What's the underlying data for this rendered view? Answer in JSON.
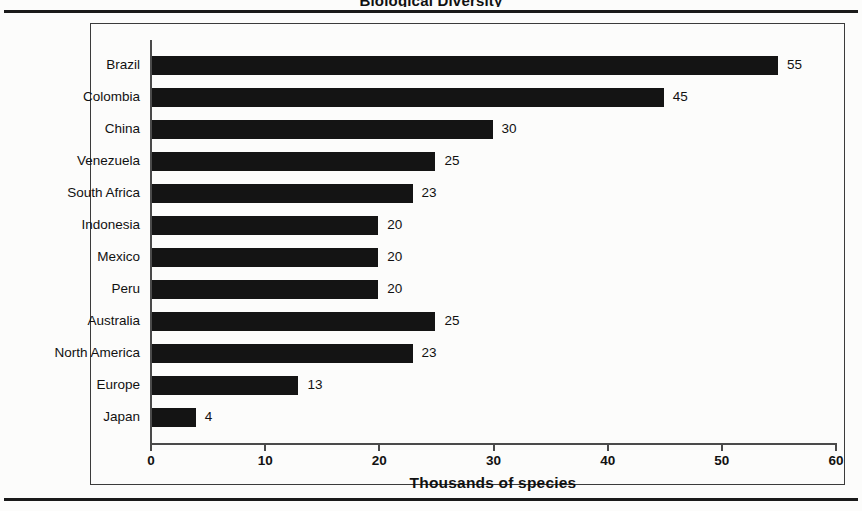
{
  "page": {
    "cut_off_title": "Biological Diversity",
    "background_color": "#fcfcfb",
    "rule_color": "#1a1a1a"
  },
  "chart_data": {
    "type": "bar",
    "orientation": "horizontal",
    "title": "Biological Diversity",
    "xlabel": "Thousands of species",
    "ylabel": "",
    "xlim": [
      0,
      60
    ],
    "xticks": [
      0,
      10,
      20,
      30,
      40,
      50,
      60
    ],
    "xtick_labels": [
      "0",
      "10",
      "20",
      "30",
      "40",
      "50",
      "60"
    ],
    "grid": false,
    "legend": false,
    "bar_color": "#141414",
    "data_labels": true,
    "categories": [
      "Brazil",
      "Colombia",
      "China",
      "Venezuela",
      "South Africa",
      "Indonesia",
      "Mexico",
      "Peru",
      "Australia",
      "North America",
      "Europe",
      "Japan"
    ],
    "values": [
      55,
      45,
      30,
      25,
      23,
      20,
      20,
      20,
      25,
      23,
      13,
      4
    ],
    "value_labels": [
      "55",
      "45",
      "30",
      "25",
      "23",
      "20",
      "20",
      "20",
      "25",
      "23",
      "13",
      "4"
    ]
  }
}
